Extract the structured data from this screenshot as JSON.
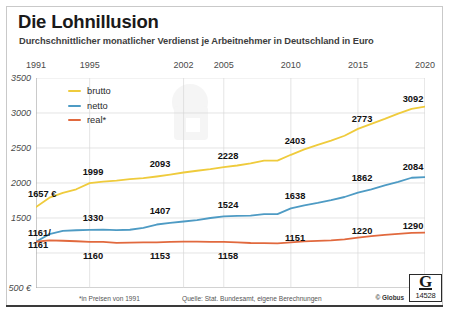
{
  "header": {
    "title": "Die Lohnillusion",
    "subtitle": "Durchschnittlicher monatlicher Verdienst je Arbeitnehmer in Deutschland in Euro"
  },
  "footer": {
    "note": "*in Preisen von 1991",
    "source": "Quelle: Stat. Bundesamt, eigene Berechnungen",
    "copyright": "© Globus",
    "logo_letter": "G",
    "logo_number": "14528"
  },
  "colors": {
    "brutto": "#EFCB3C",
    "netto": "#4E9BC4",
    "real": "#E1693E",
    "grid": "#d8d8d8",
    "axis": "#9a9a9a",
    "text": "#111111"
  },
  "chart_data": {
    "type": "line",
    "title": "Die Lohnillusion",
    "subtitle": "Durchschnittlicher monatlicher Verdienst je Arbeitnehmer in Deutschland in Euro",
    "xlabel": "",
    "ylabel": "Euro",
    "xlim": [
      1991,
      2020
    ],
    "ylim": [
      500,
      3500
    ],
    "grid": true,
    "legend_position": "top-left",
    "x_tick_labels": [
      "1991",
      "1995",
      "2002",
      "2005",
      "2010",
      "2015",
      "2020"
    ],
    "x_ticks": [
      1991,
      1995,
      2002,
      2005,
      2010,
      2015,
      2020
    ],
    "y_tick_labels": [
      "3500",
      "3000",
      "2500",
      "2000",
      "1500",
      "",
      "500 €"
    ],
    "y_ticks": [
      3500,
      3000,
      2500,
      2000,
      1500,
      1000,
      500
    ],
    "x": [
      1991,
      1992,
      1993,
      1994,
      1995,
      1996,
      1997,
      1998,
      1999,
      2000,
      2001,
      2002,
      2003,
      2004,
      2005,
      2006,
      2007,
      2008,
      2009,
      2010,
      2011,
      2012,
      2013,
      2014,
      2015,
      2016,
      2017,
      2018,
      2019,
      2020
    ],
    "series": [
      {
        "name": "brutto",
        "color": "#EFCB3C",
        "values": [
          1657,
          1790,
          1860,
          1910,
          1999,
          2020,
          2035,
          2055,
          2070,
          2093,
          2120,
          2150,
          2175,
          2198,
          2228,
          2250,
          2280,
          2320,
          2320,
          2403,
          2480,
          2545,
          2605,
          2675,
          2773,
          2845,
          2915,
          2990,
          3060,
          3092
        ]
      },
      {
        "name": "netto",
        "color": "#4E9BC4",
        "values": [
          1161,
          1270,
          1315,
          1325,
          1330,
          1335,
          1328,
          1332,
          1360,
          1407,
          1430,
          1450,
          1470,
          1500,
          1524,
          1530,
          1535,
          1555,
          1556,
          1638,
          1680,
          1715,
          1755,
          1800,
          1862,
          1910,
          1965,
          2015,
          2075,
          2084
        ]
      },
      {
        "name": "real*",
        "color": "#E1693E",
        "values": [
          1161,
          1180,
          1175,
          1168,
          1160,
          1158,
          1145,
          1148,
          1152,
          1153,
          1158,
          1162,
          1162,
          1160,
          1158,
          1152,
          1143,
          1140,
          1138,
          1151,
          1165,
          1172,
          1180,
          1195,
          1220,
          1240,
          1258,
          1272,
          1288,
          1290
        ]
      }
    ],
    "point_labels": [
      {
        "series": "brutto",
        "year": 1991,
        "text": "1657 €",
        "lx": 28,
        "ly": 194,
        "anchor": "start"
      },
      {
        "series": "brutto",
        "year": 1995,
        "text": "1999",
        "lx": 93,
        "ly": 172
      },
      {
        "series": "brutto",
        "year": 2002,
        "text": "2093",
        "lx": 160,
        "ly": 164
      },
      {
        "series": "brutto",
        "year": 2005,
        "text": "2228",
        "lx": 228,
        "ly": 156
      },
      {
        "series": "brutto",
        "year": 2010,
        "text": "2403",
        "lx": 295,
        "ly": 141
      },
      {
        "series": "brutto",
        "year": 2015,
        "text": "2773",
        "lx": 362,
        "ly": 119
      },
      {
        "series": "brutto",
        "year": 2020,
        "text": "3092",
        "lx": 413,
        "ly": 99
      },
      {
        "series": "netto",
        "year": 1991,
        "text": "1161/",
        "lx": 28,
        "ly": 233,
        "anchor": "start"
      },
      {
        "series": "netto",
        "year": 1991,
        "text": "1161",
        "lx": 28,
        "ly": 245,
        "anchor": "start"
      },
      {
        "series": "netto",
        "year": 1995,
        "text": "1330",
        "lx": 93,
        "ly": 218
      },
      {
        "series": "netto",
        "year": 2002,
        "text": "1407",
        "lx": 160,
        "ly": 211
      },
      {
        "series": "netto",
        "year": 2005,
        "text": "1524",
        "lx": 228,
        "ly": 205
      },
      {
        "series": "netto",
        "year": 2010,
        "text": "1638",
        "lx": 295,
        "ly": 196
      },
      {
        "series": "netto",
        "year": 2015,
        "text": "1862",
        "lx": 362,
        "ly": 178
      },
      {
        "series": "netto",
        "year": 2020,
        "text": "2084",
        "lx": 413,
        "ly": 167
      },
      {
        "series": "real*",
        "year": 1995,
        "text": "1160",
        "lx": 93,
        "ly": 256
      },
      {
        "series": "real*",
        "year": 2002,
        "text": "1153",
        "lx": 160,
        "ly": 256
      },
      {
        "series": "real*",
        "year": 2005,
        "text": "1158",
        "lx": 228,
        "ly": 256
      },
      {
        "series": "real*",
        "year": 2010,
        "text": "1151",
        "lx": 295,
        "ly": 238
      },
      {
        "series": "real*",
        "year": 2015,
        "text": "1220",
        "lx": 362,
        "ly": 231
      },
      {
        "series": "real*",
        "year": 2020,
        "text": "1290",
        "lx": 413,
        "ly": 226
      }
    ]
  },
  "legend": {
    "items": [
      {
        "label": "brutto",
        "color": "#EFCB3C"
      },
      {
        "label": "netto",
        "color": "#4E9BC4"
      },
      {
        "label": "real*",
        "color": "#E1693E"
      }
    ]
  }
}
